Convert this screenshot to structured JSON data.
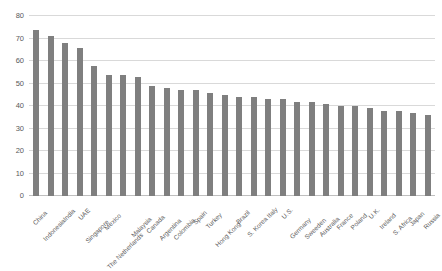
{
  "chart_data": {
    "type": "bar",
    "title": "",
    "subtitle": "",
    "xlabel": "",
    "ylabel": "",
    "ylim": [
      0,
      80
    ],
    "ytick_step": 10,
    "yticks": [
      "0",
      "10",
      "20",
      "30",
      "40",
      "50",
      "60",
      "70",
      "80"
    ],
    "grid": true,
    "legend": false,
    "legend_position": "none",
    "bar_color": "#7f7f7f",
    "gridline_color": "#d9d9d9",
    "label_color": "#595959",
    "xtick_rotation": -45,
    "categories": [
      "China",
      "Indonesia",
      "India",
      "UAE",
      "Singapore",
      "Mexico",
      "The Netherlands",
      "Malaysia",
      "Canada",
      "Argentina",
      "Colombia",
      "Spain",
      "Turkey",
      "Hong Kong",
      "Brazil",
      "S. Korea",
      "Italy",
      "U.S.",
      "Germany",
      "Sweeden",
      "Australia",
      "France",
      "Poland",
      "U.K.",
      "Ireland",
      "S. Africa",
      "Japan",
      "Russia"
    ],
    "values": [
      74,
      71,
      68,
      66,
      58,
      54,
      54,
      53,
      49,
      48,
      47,
      47,
      46,
      45,
      44,
      44,
      43,
      43,
      42,
      42,
      41,
      40,
      40,
      39,
      38,
      38,
      37,
      36
    ]
  }
}
